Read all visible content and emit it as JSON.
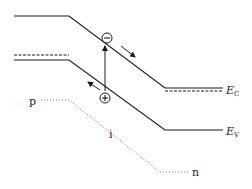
{
  "diagram": {
    "colors": {
      "line": "#1a1a1a",
      "dotted": "#555555",
      "background": "#ffffff"
    },
    "labels": {
      "conduction_band_main": "E",
      "conduction_band_sub": "C",
      "valence_band_main": "E",
      "valence_band_sub": "V",
      "p_region": "p",
      "i_region": "i",
      "n_region": "n",
      "electron_symbol": "−",
      "hole_symbol": "+"
    },
    "bands": {
      "conduction": [
        [
          14,
          16
        ],
        [
          69,
          16
        ],
        [
          165,
          88
        ],
        [
          223,
          88
        ]
      ],
      "valence": [
        [
          14,
          60
        ],
        [
          69,
          60
        ],
        [
          165,
          130
        ],
        [
          223,
          130
        ]
      ],
      "fermi_left": [
        [
          14,
          55
        ],
        [
          69,
          55
        ]
      ],
      "fermi_right": [
        [
          165,
          91
        ],
        [
          223,
          91
        ]
      ],
      "doping_profile": [
        [
          41,
          100
        ],
        [
          69,
          100
        ],
        [
          160,
          172
        ],
        [
          188,
          172
        ]
      ]
    },
    "carriers": {
      "electron": {
        "x": 107,
        "y": 38,
        "drift": "down-right"
      },
      "hole": {
        "x": 105,
        "y": 98,
        "drift": "up-left"
      }
    },
    "excitation_arrow": {
      "from": [
        105,
        91
      ],
      "to": [
        105,
        45
      ]
    }
  }
}
